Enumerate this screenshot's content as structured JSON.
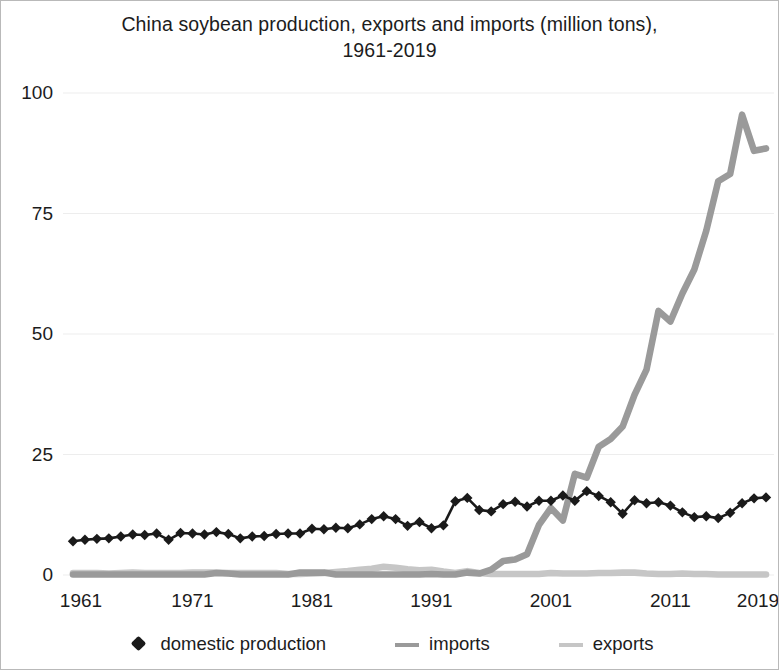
{
  "chart_data": {
    "type": "line",
    "title": "China soybean production, exports and imports (million tons), 1961-2019",
    "title_line1": "China soybean production, exports and imports (million tons),",
    "title_line2": "1961-2019",
    "xlabel": "",
    "ylabel": "",
    "xlim": [
      1961,
      2019
    ],
    "ylim": [
      0,
      100
    ],
    "ytick_values": [
      0,
      25,
      50,
      75,
      100
    ],
    "ytick_labels": [
      "0",
      "25",
      "50",
      "75",
      "100"
    ],
    "xtick_values": [
      1961,
      1971,
      1981,
      1991,
      2001,
      2011,
      2019
    ],
    "xtick_labels": [
      "1961",
      "1971",
      "1981",
      "1991",
      "2001",
      "2011",
      "2019"
    ],
    "grid": "horizontal-faint",
    "legend_position": "bottom-center",
    "x": [
      1961,
      1962,
      1963,
      1964,
      1965,
      1966,
      1967,
      1968,
      1969,
      1970,
      1971,
      1972,
      1973,
      1974,
      1975,
      1976,
      1977,
      1978,
      1979,
      1980,
      1981,
      1982,
      1983,
      1984,
      1985,
      1986,
      1987,
      1988,
      1989,
      1990,
      1991,
      1992,
      1993,
      1994,
      1995,
      1996,
      1997,
      1998,
      1999,
      2000,
      2001,
      2002,
      2003,
      2004,
      2005,
      2006,
      2007,
      2008,
      2009,
      2010,
      2011,
      2012,
      2013,
      2014,
      2015,
      2016,
      2017,
      2018,
      2019
    ],
    "series": [
      {
        "name": "domestic production",
        "color": "#1a1a1a",
        "marker": "diamond",
        "values": [
          7.0,
          7.3,
          7.5,
          7.6,
          8.0,
          8.4,
          8.3,
          8.6,
          7.3,
          8.7,
          8.6,
          8.4,
          8.9,
          8.5,
          7.6,
          8.0,
          8.1,
          8.5,
          8.6,
          8.6,
          9.6,
          9.5,
          9.8,
          9.7,
          10.5,
          11.6,
          12.2,
          11.6,
          10.2,
          11.0,
          9.7,
          10.3,
          15.3,
          16.0,
          13.5,
          13.2,
          14.7,
          15.2,
          14.2,
          15.4,
          15.4,
          16.5,
          15.4,
          17.4,
          16.4,
          15.1,
          12.7,
          15.5,
          14.9,
          15.1,
          14.4,
          13.0,
          12.0,
          12.2,
          11.8,
          12.9,
          14.9,
          15.9,
          16.1
        ]
      },
      {
        "name": "imports",
        "color": "#9a9a9a",
        "marker": "none",
        "values": [
          0.1,
          0.1,
          0.1,
          0.1,
          0.1,
          0.1,
          0.1,
          0.1,
          0.1,
          0.1,
          0.1,
          0.1,
          0.4,
          0.3,
          0.1,
          0.1,
          0.1,
          0.1,
          0.1,
          0.5,
          0.5,
          0.5,
          0.1,
          0.1,
          0.1,
          0.1,
          0.1,
          0.1,
          0.1,
          0.1,
          0.2,
          0.1,
          0.1,
          0.5,
          0.3,
          1.1,
          2.9,
          3.2,
          4.3,
          10.4,
          13.9,
          11.3,
          21.0,
          20.2,
          26.6,
          28.2,
          30.8,
          37.4,
          42.6,
          54.8,
          52.6,
          58.4,
          63.4,
          71.4,
          81.7,
          83.2,
          95.5,
          88.0,
          88.5
        ]
      },
      {
        "name": "exports",
        "color": "#c6c6c6",
        "marker": "none",
        "values": [
          0.4,
          0.4,
          0.4,
          0.3,
          0.4,
          0.5,
          0.4,
          0.4,
          0.4,
          0.4,
          0.5,
          0.5,
          0.5,
          0.4,
          0.4,
          0.4,
          0.4,
          0.4,
          0.2,
          0.2,
          0.3,
          0.4,
          0.6,
          0.8,
          1.1,
          1.3,
          1.7,
          1.5,
          1.2,
          1.0,
          1.1,
          0.7,
          0.4,
          0.8,
          0.4,
          0.2,
          0.2,
          0.2,
          0.2,
          0.2,
          0.4,
          0.3,
          0.3,
          0.3,
          0.4,
          0.4,
          0.5,
          0.5,
          0.3,
          0.2,
          0.2,
          0.3,
          0.2,
          0.2,
          0.1,
          0.1,
          0.1,
          0.1,
          0.1
        ]
      }
    ]
  },
  "legend": {
    "items": [
      {
        "label": "domestic production",
        "swatch": "diamond-marker-icon"
      },
      {
        "label": "imports",
        "swatch": "line-swatch-icon"
      },
      {
        "label": "exports",
        "swatch": "line-swatch-icon"
      }
    ]
  },
  "colors": {
    "production": "#1a1a1a",
    "imports": "#9a9a9a",
    "exports": "#c6c6c6",
    "grid": "#ededed",
    "text": "#1c1c1c",
    "background": "#ffffff",
    "border": "#b9b9b9"
  }
}
